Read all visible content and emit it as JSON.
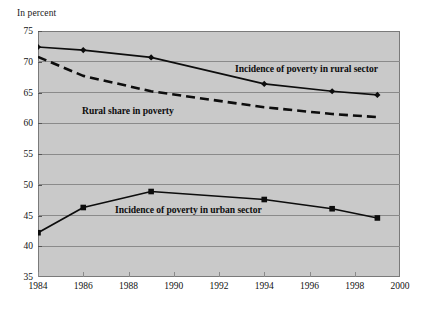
{
  "axis_title": "In percent",
  "labels": {
    "rural_incidence": "Incidence of poverty in rural sector",
    "rural_share": "Rural share in poverty",
    "urban_incidence": "Incidence of poverty in urban sector"
  },
  "colors": {
    "plot_background": "#c9c9c9",
    "plot_border": "#7a7a7a",
    "gridline": "#8a8a8a",
    "series_line": "#0d0d0d",
    "text": "#111111"
  },
  "chart_data": {
    "type": "line",
    "title": "",
    "subtitle": "",
    "xlabel": "",
    "ylabel": "In percent",
    "xlim": [
      1984,
      2000
    ],
    "ylim": [
      35,
      75
    ],
    "xticks": [
      1984,
      1986,
      1988,
      1990,
      1992,
      1994,
      1996,
      1998,
      2000
    ],
    "yticks": [
      35,
      40,
      45,
      50,
      55,
      60,
      65,
      70,
      75
    ],
    "xtick_labels": [
      "1984",
      "1986",
      "1988",
      "1990",
      "1992",
      "1994",
      "1996",
      "1998",
      "2000"
    ],
    "ytick_labels": [
      "35",
      "40",
      "45",
      "50",
      "55",
      "60",
      "65",
      "70",
      "75"
    ],
    "grid": true,
    "grid_axis": "y",
    "legend": "none",
    "annotations": [
      {
        "text": "Incidence of poverty in rural sector",
        "x": 1991.6,
        "y": 68.3
      },
      {
        "text": "Rural share in poverty",
        "x": 1986.0,
        "y": 61.7
      },
      {
        "text": "Incidence of poverty in urban sector",
        "x": 1987.5,
        "y": 44.0
      }
    ],
    "x": [
      1984,
      1986,
      1989,
      1994,
      1997,
      1999
    ],
    "series": [
      {
        "name": "Incidence of poverty in rural sector",
        "marker": "diamond",
        "linestyle": "solid",
        "values": [
          72.4,
          71.9,
          70.7,
          66.4,
          65.2,
          64.6
        ]
      },
      {
        "name": "Rural share in poverty",
        "marker": "none",
        "linestyle": "dashed",
        "values": [
          70.8,
          67.7,
          65.2,
          62.6,
          61.5,
          61.0
        ]
      },
      {
        "name": "Incidence of poverty in urban sector",
        "marker": "square",
        "linestyle": "solid",
        "values": [
          42.2,
          46.3,
          48.9,
          47.6,
          46.1,
          44.6
        ]
      }
    ]
  }
}
